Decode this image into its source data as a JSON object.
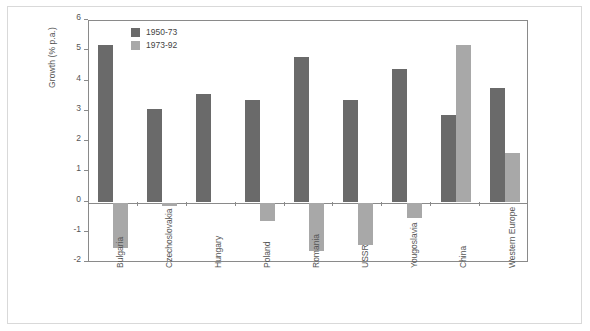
{
  "chart_data": {
    "type": "bar",
    "title": "",
    "xlabel": "",
    "ylabel": "Growth (% p.a.)",
    "ylim": [
      -2,
      6
    ],
    "yticks": [
      6,
      5,
      4,
      3,
      2,
      1,
      0,
      -1,
      -2
    ],
    "ytick_labels": [
      "6",
      "5",
      "4",
      "3",
      "2",
      "1",
      "0",
      "-1",
      "-2"
    ],
    "grid": false,
    "legend_position": "upper-left-inside",
    "categories": [
      "Bulgaria",
      "Czechoslovakia",
      "Hungary",
      "Poland",
      "Romania",
      "USSR",
      "Yougoslavia",
      "China",
      "Western Europe"
    ],
    "series": [
      {
        "name": "1950-73",
        "color": "#6a6a6a",
        "values": [
          5.2,
          3.1,
          3.6,
          3.4,
          4.8,
          3.4,
          4.4,
          2.9,
          3.8
        ]
      },
      {
        "name": "1973-92",
        "color": "#a8a8a8",
        "values": [
          -1.5,
          -0.1,
          0.0,
          -0.6,
          -1.6,
          -1.4,
          -0.5,
          5.2,
          1.65
        ]
      }
    ]
  },
  "legend": {
    "items": [
      {
        "label": "1950-73",
        "color": "#6a6a6a"
      },
      {
        "label": "1973-92",
        "color": "#a8a8a8"
      }
    ]
  },
  "colors": {
    "series_1950_73": "#6a6a6a",
    "series_1973_92": "#a8a8a8",
    "axis": "#8a8a8a",
    "text": "#555555",
    "frame": "#d9d9d9",
    "background": "#ffffff"
  }
}
